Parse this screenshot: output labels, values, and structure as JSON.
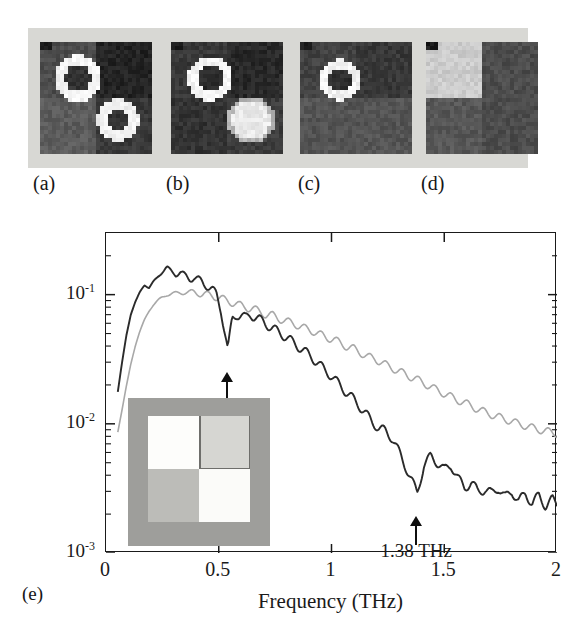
{
  "figure": {
    "panels": [
      {
        "id": "a",
        "label": "(a)",
        "name": "thz-image-panel-a",
        "description": "terahertz amplitude image, two bright ring features"
      },
      {
        "id": "b",
        "label": "(b)",
        "name": "thz-image-panel-b",
        "description": "terahertz amplitude image, upper ring and lower bright blob"
      },
      {
        "id": "c",
        "label": "(c)",
        "name": "thz-image-panel-c",
        "description": "terahertz amplitude image, single upper-left ring"
      },
      {
        "id": "d",
        "label": "(d)",
        "name": "thz-image-panel-d",
        "description": "terahertz amplitude image, large light region upper-left"
      },
      {
        "id": "e",
        "label": "(e)",
        "name": "fft-spectrum-panel-e",
        "description": "FFT amplitude spectrum"
      }
    ],
    "inset": {
      "name": "sample-photograph-inset",
      "background_color": "#9e9e9b",
      "cells": [
        {
          "position": "top-left",
          "color": "#fdfdfb"
        },
        {
          "position": "top-right",
          "color": "#d6d6d2"
        },
        {
          "position": "bottom-left",
          "color": "#bcbcb8"
        },
        {
          "position": "bottom-right",
          "color": "#fbfbf9"
        }
      ]
    },
    "colors": {
      "axis": "#1a1a1a",
      "curve_dark": "#2b2b2b",
      "curve_light": "#a8a8a8",
      "panel_background": "#d8d8d4"
    }
  },
  "chart_data": {
    "type": "line",
    "title": "",
    "xlabel": "Frequency (THz)",
    "ylabel": "FFT amplitude",
    "xlim": [
      0,
      2
    ],
    "ylim": [
      0.001,
      0.3
    ],
    "yscale": "log",
    "xticks": [
      0,
      0.5,
      1,
      1.5,
      2
    ],
    "xtick_labels": [
      "0",
      "0.5",
      "1",
      "1.5",
      "2"
    ],
    "yticks": [
      0.1,
      0.01,
      0.001
    ],
    "ytick_labels": [
      "10-1",
      "10-2",
      "10-3"
    ],
    "ytick_exponents": [
      "-1",
      "-2",
      "-3"
    ],
    "ytick_mantissa": "10",
    "grid": false,
    "legend_position": "none",
    "annotations": [
      {
        "text": "0.54 THz",
        "x": 0.54,
        "y": 0.018,
        "arrow": "up",
        "points_to_y": 0.038
      },
      {
        "text": "1.38 THz",
        "x": 1.38,
        "y": 0.0016,
        "arrow": "up",
        "points_to_y": 0.0029
      }
    ],
    "series": [
      {
        "name": "reference-spectrum",
        "color": "#a8a8a8",
        "x": [
          0.05,
          0.07,
          0.09,
          0.11,
          0.13,
          0.15,
          0.17,
          0.19,
          0.21,
          0.23,
          0.25,
          0.27,
          0.29,
          0.31,
          0.33,
          0.35,
          0.37,
          0.39,
          0.41,
          0.43,
          0.45,
          0.47,
          0.49,
          0.51,
          0.53,
          0.55,
          0.57,
          0.59,
          0.61,
          0.63,
          0.65,
          0.68,
          0.71,
          0.74,
          0.77,
          0.8,
          0.83,
          0.86,
          0.89,
          0.92,
          0.95,
          0.98,
          1.01,
          1.04,
          1.07,
          1.1,
          1.13,
          1.16,
          1.19,
          1.22,
          1.25,
          1.28,
          1.31,
          1.34,
          1.37,
          1.4,
          1.43,
          1.46,
          1.49,
          1.52,
          1.55,
          1.58,
          1.61,
          1.64,
          1.67,
          1.7,
          1.73,
          1.76,
          1.79,
          1.82,
          1.85,
          1.88,
          1.91,
          1.94,
          1.97,
          2.0
        ],
        "y": [
          0.0082,
          0.0125,
          0.0195,
          0.029,
          0.04,
          0.052,
          0.064,
          0.074,
          0.083,
          0.09,
          0.096,
          0.1,
          0.101,
          0.102,
          0.104,
          0.105,
          0.103,
          0.104,
          0.1035,
          0.101,
          0.099,
          0.098,
          0.096,
          0.094,
          0.09,
          0.088,
          0.086,
          0.083,
          0.081,
          0.079,
          0.078,
          0.074,
          0.07,
          0.069,
          0.065,
          0.062,
          0.06,
          0.057,
          0.054,
          0.052,
          0.049,
          0.0465,
          0.045,
          0.042,
          0.0395,
          0.038,
          0.0355,
          0.033,
          0.032,
          0.03,
          0.028,
          0.0265,
          0.025,
          0.0235,
          0.0225,
          0.021,
          0.0198,
          0.0185,
          0.0175,
          0.0165,
          0.0155,
          0.0148,
          0.014,
          0.0132,
          0.0125,
          0.012,
          0.0114,
          0.011,
          0.0106,
          0.0101,
          0.0098,
          0.0094,
          0.0091,
          0.0089,
          0.0086,
          0.0084
        ]
      },
      {
        "name": "sample-spectrum",
        "color": "#2b2b2b",
        "x": [
          0.05,
          0.07,
          0.09,
          0.11,
          0.13,
          0.15,
          0.17,
          0.19,
          0.21,
          0.23,
          0.25,
          0.27,
          0.29,
          0.31,
          0.33,
          0.35,
          0.37,
          0.39,
          0.41,
          0.43,
          0.45,
          0.47,
          0.49,
          0.51,
          0.53,
          0.54,
          0.56,
          0.58,
          0.6,
          0.62,
          0.64,
          0.67,
          0.7,
          0.73,
          0.76,
          0.79,
          0.82,
          0.85,
          0.88,
          0.91,
          0.94,
          0.97,
          1.0,
          1.03,
          1.06,
          1.09,
          1.12,
          1.15,
          1.18,
          1.21,
          1.24,
          1.27,
          1.3,
          1.33,
          1.36,
          1.38,
          1.41,
          1.44,
          1.47,
          1.5,
          1.53,
          1.56,
          1.59,
          1.62,
          1.65,
          1.68,
          1.71,
          1.74,
          1.77,
          1.8,
          1.83,
          1.86,
          1.89,
          1.92,
          1.95,
          1.98,
          2.0
        ],
        "y": [
          0.0165,
          0.029,
          0.048,
          0.07,
          0.088,
          0.105,
          0.118,
          0.112,
          0.126,
          0.138,
          0.15,
          0.162,
          0.152,
          0.144,
          0.148,
          0.14,
          0.133,
          0.136,
          0.129,
          0.123,
          0.118,
          0.11,
          0.099,
          0.076,
          0.048,
          0.037,
          0.065,
          0.07,
          0.069,
          0.066,
          0.07,
          0.066,
          0.061,
          0.056,
          0.052,
          0.048,
          0.044,
          0.04,
          0.0365,
          0.033,
          0.0295,
          0.026,
          0.0235,
          0.0205,
          0.018,
          0.016,
          0.014,
          0.0121,
          0.0104,
          0.0092,
          0.0088,
          0.0077,
          0.006,
          0.0046,
          0.0035,
          0.0029,
          0.0048,
          0.0056,
          0.005,
          0.0044,
          0.0048,
          0.0038,
          0.0032,
          0.0035,
          0.003,
          0.0031,
          0.0029,
          0.0032,
          0.0027,
          0.003,
          0.0025,
          0.0029,
          0.0024,
          0.0028,
          0.0023,
          0.0026,
          0.0024
        ]
      }
    ]
  }
}
